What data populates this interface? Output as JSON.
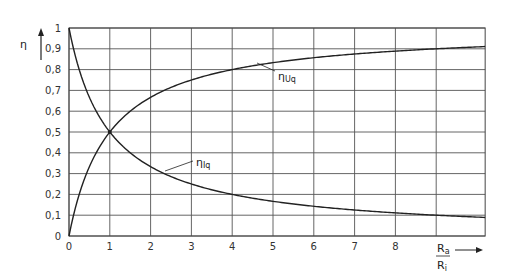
{
  "chart_data": {
    "type": "line",
    "title": "",
    "xlabel": "Ra/Ri",
    "xlabel_numerator": "R",
    "xlabel_numerator_sub": "a",
    "xlabel_denominator": "R",
    "xlabel_denominator_sub": "i",
    "ylabel": "η",
    "xlim": [
      0,
      10.2
    ],
    "ylim": [
      0,
      1
    ],
    "x_ticks": [
      "0",
      "1",
      "2",
      "3",
      "4",
      "5",
      "6",
      "7",
      "8"
    ],
    "y_ticks": [
      "0",
      "0,1",
      "0,2",
      "0,3",
      "0,4",
      "0,5",
      "0,6",
      "0,7",
      "0,8",
      "0,9",
      "1"
    ],
    "grid": true,
    "legend": null,
    "x": [
      0,
      0.25,
      0.5,
      0.75,
      1,
      1.5,
      2,
      2.5,
      3,
      4,
      5,
      6,
      7,
      8,
      9,
      10.2
    ],
    "series": [
      {
        "name": "ηUq",
        "label_main": "η",
        "label_sub": "Uq",
        "values": [
          0,
          0.2,
          0.333,
          0.429,
          0.5,
          0.6,
          0.667,
          0.714,
          0.75,
          0.8,
          0.833,
          0.857,
          0.875,
          0.889,
          0.9,
          0.911
        ]
      },
      {
        "name": "ηIq",
        "label_main": "η",
        "label_sub": "Iq",
        "values": [
          1,
          0.8,
          0.667,
          0.571,
          0.5,
          0.4,
          0.333,
          0.286,
          0.25,
          0.2,
          0.167,
          0.143,
          0.125,
          0.111,
          0.1,
          0.089
        ]
      }
    ],
    "annotations": [
      {
        "text": "ηUq",
        "points_to": {
          "x": 4.5,
          "y": 0.818
        }
      },
      {
        "text": "ηIq",
        "points_to": {
          "x": 2.2,
          "y": 0.312
        }
      }
    ],
    "intersection": {
      "x": 1,
      "y": 0.5
    }
  }
}
